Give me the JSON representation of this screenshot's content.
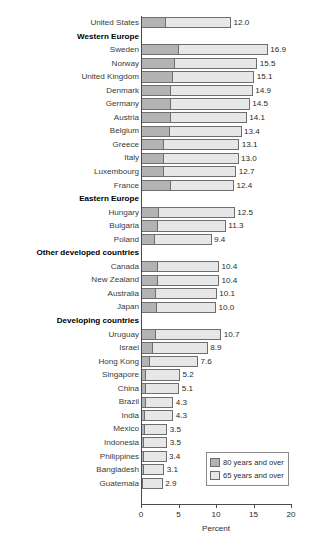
{
  "chart_data": {
    "type": "bar",
    "orientation": "horizontal",
    "stacked": false,
    "title": "",
    "xlabel": "Percent",
    "ylabel": "",
    "xlim": [
      0,
      20
    ],
    "xticks": [
      0,
      5,
      10,
      15,
      20
    ],
    "xtick_labels": [
      "0",
      "5",
      "10",
      "15",
      "20"
    ],
    "grid": false,
    "legend_position": "inside-bottom-right",
    "legend": [
      {
        "name": "80 years and over",
        "color": "#b3b3b3"
      },
      {
        "name": "65 years and over",
        "color": "#e7e7e7"
      }
    ],
    "series": [
      {
        "name": "65 years and over",
        "color": "#e7e7e7"
      },
      {
        "name": "80 years and over",
        "color": "#b3b3b3"
      }
    ],
    "rows": [
      {
        "label": "United States",
        "group": false,
        "v65": 12.0,
        "v80": 3.3,
        "value_label": "12.0"
      },
      {
        "label": "Western Europe",
        "group": true
      },
      {
        "label": "Sweden",
        "group": false,
        "v65": 16.9,
        "v80": 5.0,
        "value_label": "16.9"
      },
      {
        "label": "Norway",
        "group": false,
        "v65": 15.5,
        "v80": 4.5,
        "value_label": "15.5"
      },
      {
        "label": "United Kingdom",
        "group": false,
        "v65": 15.1,
        "v80": 4.2,
        "value_label": "15.1"
      },
      {
        "label": "Denmark",
        "group": false,
        "v65": 14.9,
        "v80": 4.0,
        "value_label": "14.9"
      },
      {
        "label": "Germany",
        "group": false,
        "v65": 14.5,
        "v80": 4.0,
        "value_label": "14.5"
      },
      {
        "label": "Austria",
        "group": false,
        "v65": 14.1,
        "v80": 4.0,
        "value_label": "14.1"
      },
      {
        "label": "Belgium",
        "group": false,
        "v65": 13.4,
        "v80": 3.8,
        "value_label": "13.4"
      },
      {
        "label": "Greece",
        "group": false,
        "v65": 13.1,
        "v80": 3.0,
        "value_label": "13.1"
      },
      {
        "label": "Italy",
        "group": false,
        "v65": 13.0,
        "v80": 3.0,
        "value_label": "13.0"
      },
      {
        "label": "Luxembourg",
        "group": false,
        "v65": 12.7,
        "v80": 3.1,
        "value_label": "12.7"
      },
      {
        "label": "France",
        "group": false,
        "v65": 12.4,
        "v80": 4.0,
        "value_label": "12.4"
      },
      {
        "label": "Eastern Europe",
        "group": true
      },
      {
        "label": "Hungary",
        "group": false,
        "v65": 12.5,
        "v80": 2.4,
        "value_label": "12.5"
      },
      {
        "label": "Bulgaria",
        "group": false,
        "v65": 11.3,
        "v80": 2.3,
        "value_label": "11.3"
      },
      {
        "label": "Poland",
        "group": false,
        "v65": 9.4,
        "v80": 1.8,
        "value_label": "9.4"
      },
      {
        "label": "Other developed countries",
        "group": true
      },
      {
        "label": "Canada",
        "group": false,
        "v65": 10.4,
        "v80": 2.2,
        "value_label": "10.4"
      },
      {
        "label": "New Zealand",
        "group": false,
        "v65": 10.4,
        "v80": 2.2,
        "value_label": "10.4"
      },
      {
        "label": "Australia",
        "group": false,
        "v65": 10.1,
        "v80": 2.0,
        "value_label": "10.1"
      },
      {
        "label": "Japan",
        "group": false,
        "v65": 10.0,
        "v80": 2.1,
        "value_label": "10.0"
      },
      {
        "label": "Developing countries",
        "group": true
      },
      {
        "label": "Uruguay",
        "group": false,
        "v65": 10.7,
        "v80": 2.0,
        "value_label": "10.7"
      },
      {
        "label": "Israel",
        "group": false,
        "v65": 8.9,
        "v80": 1.6,
        "value_label": "8.9"
      },
      {
        "label": "Hong Kong",
        "group": false,
        "v65": 7.6,
        "v80": 1.2,
        "value_label": "7.6"
      },
      {
        "label": "Singapore",
        "group": false,
        "v65": 5.2,
        "v80": 0.7,
        "value_label": "5.2"
      },
      {
        "label": "China",
        "group": false,
        "v65": 5.1,
        "v80": 0.7,
        "value_label": "5.1"
      },
      {
        "label": "Brazil",
        "group": false,
        "v65": 4.3,
        "v80": 0.6,
        "value_label": "4.3"
      },
      {
        "label": "India",
        "group": false,
        "v65": 4.3,
        "v80": 0.5,
        "value_label": "4.3"
      },
      {
        "label": "Mexico",
        "group": false,
        "v65": 3.5,
        "v80": 0.5,
        "value_label": "3.5"
      },
      {
        "label": "Indonesia",
        "group": false,
        "v65": 3.5,
        "v80": 0.4,
        "value_label": "3.5"
      },
      {
        "label": "Philippines",
        "group": false,
        "v65": 3.4,
        "v80": 0.4,
        "value_label": "3.4"
      },
      {
        "label": "Bangladesh",
        "group": false,
        "v65": 3.1,
        "v80": 0.4,
        "value_label": "3.1"
      },
      {
        "label": "Guatemala",
        "group": false,
        "v65": 2.9,
        "v80": 0.3,
        "value_label": "2.9"
      }
    ]
  }
}
